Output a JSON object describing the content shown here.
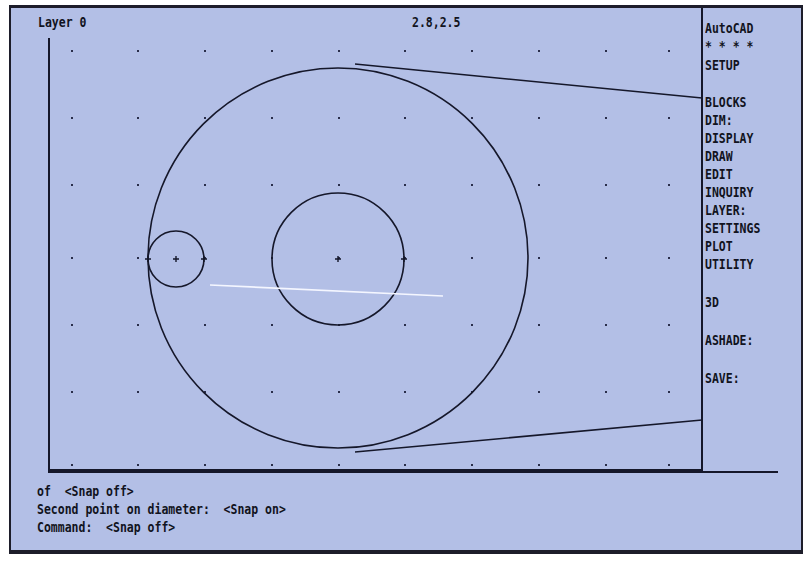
{
  "app": {
    "name": "AutoCAD"
  },
  "status_bar": {
    "layer": "Layer 0",
    "coordinates": "2.8,2.5"
  },
  "screen_menu": {
    "items": [
      {
        "label": "AutoCAD",
        "top": 6
      },
      {
        "label": "* * * *",
        "top": 24
      },
      {
        "label": "SETUP",
        "top": 43
      },
      {
        "label": "BLOCKS",
        "top": 80
      },
      {
        "label": "DIM:",
        "top": 98
      },
      {
        "label": "DISPLAY",
        "top": 116
      },
      {
        "label": "DRAW",
        "top": 134
      },
      {
        "label": "EDIT",
        "top": 152
      },
      {
        "label": "INQUIRY",
        "top": 170
      },
      {
        "label": "LAYER:",
        "top": 188
      },
      {
        "label": "SETTINGS",
        "top": 206
      },
      {
        "label": "PLOT",
        "top": 224
      },
      {
        "label": "UTILITY",
        "top": 242
      },
      {
        "label": "3D",
        "top": 280
      },
      {
        "label": "ASHADE:",
        "top": 318
      },
      {
        "label": "SAVE:",
        "top": 356
      }
    ]
  },
  "command_area": {
    "lines": [
      "of  <Snap off>",
      "Second point on diameter:  <Snap on>",
      "Command:  <Snap off>"
    ]
  },
  "drawing": {
    "grid_x": [
      72,
      138,
      205,
      272,
      339,
      405,
      472,
      539,
      606,
      669
    ],
    "grid_y": [
      51,
      118,
      185,
      258,
      325,
      392,
      465
    ],
    "circles": [
      {
        "name": "large-circle",
        "cx": 338,
        "cy": 258,
        "r": 190
      },
      {
        "name": "medium-circle",
        "cx": 338,
        "cy": 259,
        "r": 66
      },
      {
        "name": "small-circle",
        "cx": 176,
        "cy": 259,
        "r": 28
      }
    ],
    "lines": [
      {
        "name": "upper-tangent-line",
        "x1": 355,
        "y1": 64,
        "x2": 702,
        "y2": 98
      },
      {
        "name": "lower-tangent-line",
        "x1": 355,
        "y1": 452,
        "x2": 702,
        "y2": 420
      }
    ],
    "rubberband": {
      "x1": 210,
      "y1": 285,
      "x2": 443,
      "y2": 296
    },
    "colors": {
      "background": "#b3bfe6",
      "ink": "#15172a",
      "rubberband": "#f4f6ff"
    }
  }
}
